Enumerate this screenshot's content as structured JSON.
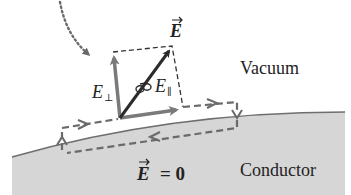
{
  "labels": {
    "field_vector": "E",
    "perp_component": "E",
    "perp_subscript": "⊥",
    "parallel_component": "E",
    "parallel_subscript": "∥",
    "region_top": "Vacuum",
    "region_bottom": "Conductor",
    "inside_field": "E",
    "inside_field_rest": "= 0"
  },
  "colors": {
    "background": "#ffffff",
    "conductor_fill": "#d6d6d6",
    "surface_line": "#6e6e6e",
    "dashed_path": "#6a6a6a",
    "main_arrow": "#2b2b2b",
    "component_arrow": "#7a7a7a",
    "text": "#222222"
  },
  "icons": {
    "curl_symbol": "curl-loop-icon",
    "dotted_arrow": "dotted-curved-arrow-icon"
  }
}
